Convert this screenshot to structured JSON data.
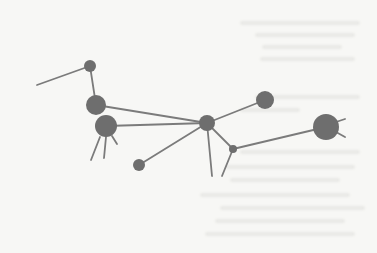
{
  "diagram": {
    "type": "network-graph",
    "colors": {
      "background": "#f7f7f5",
      "node": "#6e6e6e",
      "edge": "#7b7b7b",
      "ghost_text": "#e9e9e6"
    },
    "nodes": [
      {
        "id": "n1",
        "x": 90,
        "y": 66,
        "r": 6
      },
      {
        "id": "n2",
        "x": 96,
        "y": 105,
        "r": 10
      },
      {
        "id": "n3",
        "x": 106,
        "y": 126,
        "r": 11
      },
      {
        "id": "hub",
        "x": 207,
        "y": 123,
        "r": 8
      },
      {
        "id": "n5",
        "x": 265,
        "y": 100,
        "r": 9
      },
      {
        "id": "n6",
        "x": 139,
        "y": 165,
        "r": 6
      },
      {
        "id": "n7",
        "x": 233,
        "y": 149,
        "r": 4
      },
      {
        "id": "n8",
        "x": 326,
        "y": 127,
        "r": 13
      }
    ],
    "edges": [
      {
        "from": "n1",
        "to": "n2"
      },
      {
        "from": "n2",
        "to": "hub"
      },
      {
        "from": "n3",
        "to": "hub"
      },
      {
        "from": "hub",
        "to": "n5"
      },
      {
        "from": "hub",
        "to": "n6"
      },
      {
        "from": "hub",
        "to": "n7"
      },
      {
        "from": "n7",
        "to": "n8"
      }
    ],
    "dangling_edges": [
      {
        "x1": 90,
        "y1": 66,
        "x2": 37,
        "y2": 85
      },
      {
        "x1": 100,
        "y1": 137,
        "x2": 91,
        "y2": 160
      },
      {
        "x1": 106,
        "y1": 137,
        "x2": 104,
        "y2": 158
      },
      {
        "x1": 112,
        "y1": 136,
        "x2": 117,
        "y2": 144
      },
      {
        "x1": 207,
        "y1": 123,
        "x2": 212,
        "y2": 176
      },
      {
        "x1": 233,
        "y1": 149,
        "x2": 222,
        "y2": 176
      },
      {
        "x1": 336,
        "y1": 122,
        "x2": 345,
        "y2": 119
      },
      {
        "x1": 336,
        "y1": 132,
        "x2": 345,
        "y2": 137
      }
    ],
    "ghost_text_lines": [
      {
        "x": 240,
        "y": 21,
        "w": 120
      },
      {
        "x": 255,
        "y": 33,
        "w": 100
      },
      {
        "x": 262,
        "y": 45,
        "w": 80
      },
      {
        "x": 260,
        "y": 57,
        "w": 95
      },
      {
        "x": 255,
        "y": 95,
        "w": 105
      },
      {
        "x": 240,
        "y": 108,
        "w": 60
      },
      {
        "x": 240,
        "y": 150,
        "w": 120
      },
      {
        "x": 225,
        "y": 165,
        "w": 130
      },
      {
        "x": 230,
        "y": 178,
        "w": 110
      },
      {
        "x": 200,
        "y": 193,
        "w": 150
      },
      {
        "x": 220,
        "y": 206,
        "w": 145
      },
      {
        "x": 215,
        "y": 219,
        "w": 130
      },
      {
        "x": 205,
        "y": 232,
        "w": 150
      }
    ]
  }
}
